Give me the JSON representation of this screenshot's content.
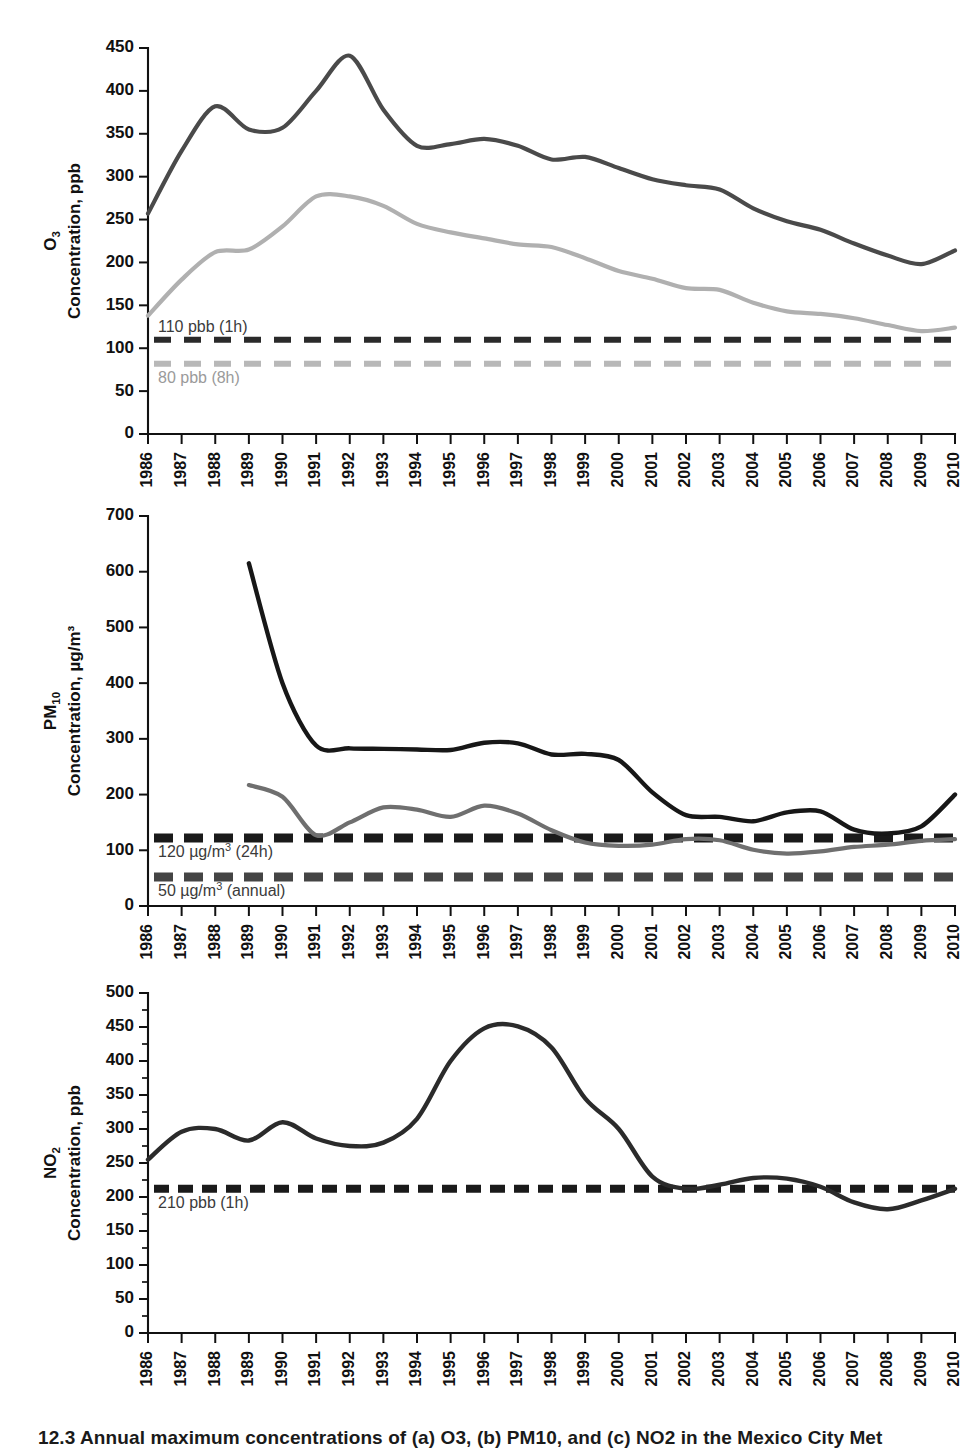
{
  "figure": {
    "caption": "12.3  Annual maximum concentrations of (a) O3, (b) PM10, and (c) NO2 in the Mexico City Met"
  },
  "chart_data": [
    {
      "type": "line",
      "panel_id": "a",
      "title": "",
      "ylabel_main": "O3",
      "ylabel_sub": "Concentration, ppb",
      "xlabel": "",
      "ylim": [
        0,
        450
      ],
      "ytick_step": 50,
      "yticks": [
        0,
        50,
        100,
        150,
        200,
        250,
        300,
        350,
        400,
        450
      ],
      "grid": false,
      "legend": "none",
      "x": [
        1986,
        1987,
        1988,
        1989,
        1990,
        1991,
        1992,
        1993,
        1994,
        1995,
        1996,
        1997,
        1998,
        1999,
        2000,
        2001,
        2002,
        2003,
        2004,
        2005,
        2006,
        2007,
        2008,
        2009,
        2010
      ],
      "xtick_labels": [
        "1986",
        "1987",
        "1988",
        "1989",
        "1990",
        "1991",
        "1992",
        "1993",
        "1994",
        "1995",
        "1996",
        "1997",
        "1998",
        "1999",
        "2000",
        "2001",
        "2002",
        "2003",
        "2004",
        "2005",
        "2006",
        "2007",
        "2008",
        "2009",
        "2010"
      ],
      "series": [
        {
          "name": "O3 1-hour maximum",
          "color": "#4a4a4a",
          "width": 4.2,
          "values": [
            257,
            330,
            382,
            355,
            357,
            400,
            441,
            378,
            336,
            338,
            344,
            336,
            320,
            323,
            310,
            297,
            290,
            285,
            263,
            248,
            238,
            222,
            208,
            198,
            214
          ]
        },
        {
          "name": "O3 8-hour maximum",
          "color": "#b0b0b0",
          "width": 4.2,
          "values": [
            138,
            180,
            212,
            215,
            242,
            277,
            277,
            266,
            245,
            235,
            228,
            221,
            218,
            205,
            190,
            181,
            170,
            168,
            153,
            143,
            140,
            135,
            127,
            120,
            124
          ]
        }
      ],
      "thresholds": [
        {
          "label": "110 pbb (1h)",
          "value": 110,
          "color": "#2a2a2a",
          "label_position": "above"
        },
        {
          "label": "80 pbb (8h)",
          "value": 82,
          "color": "#b8b8b8",
          "label_position": "below"
        }
      ]
    },
    {
      "type": "line",
      "panel_id": "b",
      "title": "",
      "ylabel_main": "PM10",
      "ylabel_sub": "Concentration, µg/m³",
      "xlabel": "",
      "ylim": [
        0,
        700
      ],
      "ytick_step": 100,
      "yticks": [
        0,
        100,
        200,
        300,
        400,
        500,
        600,
        700
      ],
      "grid": false,
      "legend": "none",
      "x": [
        1986,
        1987,
        1988,
        1989,
        1990,
        1991,
        1992,
        1993,
        1994,
        1995,
        1996,
        1997,
        1998,
        1999,
        2000,
        2001,
        2002,
        2003,
        2004,
        2005,
        2006,
        2007,
        2008,
        2009,
        2010
      ],
      "xtick_labels": [
        "1986",
        "1987",
        "1988",
        "1989",
        "1990",
        "1991",
        "1992",
        "1993",
        "1994",
        "1995",
        "1996",
        "1997",
        "1998",
        "1999",
        "2000",
        "2001",
        "2002",
        "2003",
        "2004",
        "2005",
        "2006",
        "2007",
        "2008",
        "2009",
        "2010"
      ],
      "series": [
        {
          "name": "PM10 24-hour maximum",
          "color": "#171717",
          "width": 4.4,
          "start_index": 3,
          "values": [
            null,
            null,
            null,
            615,
            400,
            288,
            283,
            282,
            281,
            280,
            293,
            292,
            272,
            273,
            262,
            204,
            163,
            160,
            152,
            168,
            170,
            137,
            130,
            143,
            200,
            185
          ]
        },
        {
          "name": "PM10 annual average maximum",
          "color": "#6f6f6f",
          "width": 4.2,
          "start_index": 3,
          "values": [
            null,
            null,
            null,
            217,
            196,
            127,
            150,
            177,
            173,
            160,
            180,
            166,
            136,
            114,
            108,
            110,
            120,
            118,
            101,
            94,
            98,
            106,
            110,
            117,
            120
          ]
        }
      ],
      "thresholds": [
        {
          "label": "120 µg/m³ (24h)",
          "value": 122,
          "color": "#1a1a1a",
          "label_position": "below"
        },
        {
          "label": "50 µg/m³ (annual)",
          "value": 52,
          "color": "#444444",
          "label_position": "below"
        }
      ]
    },
    {
      "type": "line",
      "panel_id": "c",
      "title": "",
      "ylabel_main": "NO2",
      "ylabel_sub": "Concentration, ppb",
      "xlabel": "",
      "ylim": [
        0,
        500
      ],
      "ytick_step": 50,
      "yticks": [
        0,
        50,
        100,
        150,
        200,
        250,
        300,
        350,
        400,
        450,
        500
      ],
      "grid": false,
      "legend": "none",
      "x": [
        1986,
        1987,
        1988,
        1989,
        1990,
        1991,
        1992,
        1993,
        1994,
        1995,
        1996,
        1997,
        1998,
        1999,
        2000,
        2001,
        2002,
        2003,
        2004,
        2005,
        2006,
        2007,
        2008,
        2009,
        2010
      ],
      "xtick_labels": [
        "1986",
        "1987",
        "1988",
        "1989",
        "1990",
        "1991",
        "1992",
        "1993",
        "1994",
        "1995",
        "1996",
        "1997",
        "1998",
        "1999",
        "2000",
        "2001",
        "2002",
        "2003",
        "2004",
        "2005",
        "2006",
        "2007",
        "2008",
        "2009",
        "2010"
      ],
      "series": [
        {
          "name": "NO2 1-hour maximum",
          "color": "#2b2b2b",
          "width": 4.4,
          "values": [
            255,
            296,
            300,
            283,
            310,
            286,
            275,
            280,
            315,
            400,
            448,
            451,
            420,
            345,
            300,
            230,
            212,
            218,
            228,
            227,
            215,
            192,
            182,
            195,
            212
          ]
        }
      ],
      "thresholds": [
        {
          "label": "210 pbb (1h)",
          "value": 212,
          "color": "#1a1a1a",
          "label_position": "below"
        }
      ]
    }
  ]
}
